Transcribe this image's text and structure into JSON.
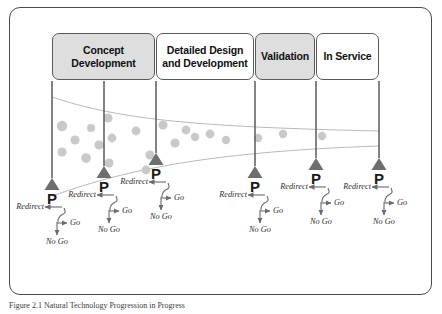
{
  "figure": {
    "caption": "Figure  2.1   Natural Technology Progression in Progress"
  },
  "phases": [
    {
      "label": "Concept Development",
      "fill": "#dedede",
      "x": 52,
      "y": 33,
      "w": 103,
      "h": 47
    },
    {
      "label": "Detailed Design and Development",
      "fill": "#ffffff",
      "x": 156,
      "y": 33,
      "w": 98,
      "h": 47
    },
    {
      "label": "Validation",
      "fill": "#dedede",
      "x": 255,
      "y": 33,
      "w": 60,
      "h": 47
    },
    {
      "label": "In Service",
      "fill": "#ffffff",
      "x": 316,
      "y": 33,
      "w": 63,
      "h": 47
    }
  ],
  "gates": [
    {
      "id": "gate-1",
      "p_label": "P",
      "stem_x": 52,
      "stem_top": 81,
      "tri_y": 178,
      "redirect": "Redirect",
      "go": "Go",
      "no_go": "No Go"
    },
    {
      "id": "gate-2",
      "p_label": "P",
      "stem_x": 104,
      "stem_top": 81,
      "tri_y": 166,
      "redirect": "Redirect",
      "go": "Go",
      "no_go": "No Go"
    },
    {
      "id": "gate-3",
      "p_label": "P",
      "stem_x": 156,
      "stem_top": 81,
      "tri_y": 153,
      "redirect": "Redirect",
      "go": "Go",
      "no_go": "No Go"
    },
    {
      "id": "gate-4",
      "p_label": "P",
      "stem_x": 255,
      "stem_top": 81,
      "tri_y": 166,
      "redirect": "Redirect",
      "go": "Go",
      "no_go": "No Go"
    },
    {
      "id": "gate-5",
      "p_label": "P",
      "stem_x": 316,
      "stem_top": 81,
      "tri_y": 158,
      "redirect": "Redirect",
      "go": "Go",
      "no_go": "No Go"
    },
    {
      "id": "gate-6",
      "p_label": "P",
      "stem_x": 379,
      "stem_top": 81,
      "tri_y": 158,
      "redirect": "Redirect",
      "go": "Go",
      "no_go": "No Go"
    }
  ],
  "funnel": {
    "upper_curve": "M 52 97 C 120 120, 200 127, 379 131",
    "lower_curve": "M 52 196 C 120 172, 200 152, 379 146",
    "stroke": "#b9b9b9"
  },
  "dots": {
    "color": "#c9c9c9",
    "points": [
      {
        "x": 62,
        "y": 126,
        "r": 5.2
      },
      {
        "x": 91,
        "y": 128,
        "r": 4.0
      },
      {
        "x": 75,
        "y": 140,
        "r": 4.6
      },
      {
        "x": 99,
        "y": 145,
        "r": 4.6
      },
      {
        "x": 62,
        "y": 152,
        "r": 4.6
      },
      {
        "x": 86,
        "y": 158,
        "r": 4.8
      },
      {
        "x": 108,
        "y": 118,
        "r": 4.6
      },
      {
        "x": 112,
        "y": 138,
        "r": 4.4
      },
      {
        "x": 109,
        "y": 163,
        "r": 4.6
      },
      {
        "x": 136,
        "y": 131,
        "r": 4.4
      },
      {
        "x": 150,
        "y": 155,
        "r": 4.6
      },
      {
        "x": 146,
        "y": 170,
        "r": 4.4
      },
      {
        "x": 163,
        "y": 125,
        "r": 4.6
      },
      {
        "x": 175,
        "y": 143,
        "r": 4.6
      },
      {
        "x": 186,
        "y": 130,
        "r": 4.4
      },
      {
        "x": 195,
        "y": 137,
        "r": 4.2
      },
      {
        "x": 210,
        "y": 134,
        "r": 4.4
      },
      {
        "x": 226,
        "y": 140,
        "r": 4.2
      },
      {
        "x": 258,
        "y": 138,
        "r": 4.2
      },
      {
        "x": 283,
        "y": 134,
        "r": 4.2
      },
      {
        "x": 322,
        "y": 136,
        "r": 4.2
      }
    ]
  },
  "colors": {
    "frame_border": "#4a4a4a",
    "box_border": "#5a5a5a",
    "box_gray": "#dedede",
    "triangle": "#6e6e6e",
    "stem": "#5a5a5a",
    "arrow": "#6b6b6b",
    "text": "#1a1a1a"
  }
}
